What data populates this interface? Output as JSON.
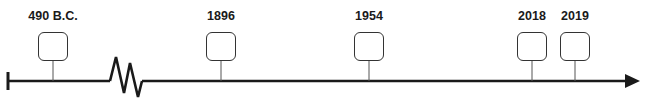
{
  "timeline": {
    "events": [
      {
        "label": "490 B.C.",
        "x": 53
      },
      {
        "label": "1896",
        "x": 221
      },
      {
        "label": "1954",
        "x": 369
      },
      {
        "label": "2018",
        "x": 532
      },
      {
        "label": "2019",
        "x": 575
      }
    ],
    "has_break": true,
    "arrow_direction": "right",
    "line_color": "#1a1a1a"
  }
}
